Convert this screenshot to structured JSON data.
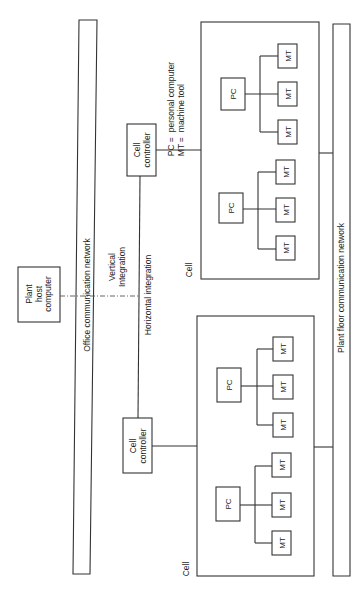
{
  "diagram": {
    "plant_host": {
      "label_lines": [
        "Plant",
        "host",
        "computer"
      ]
    },
    "office_network": {
      "label": "Office communication network"
    },
    "plant_floor_network": {
      "label": "Plant floor communication network"
    },
    "vertical_integration": {
      "label_lines": [
        "Vertical",
        "Integration"
      ]
    },
    "horizontal_integration": {
      "label": "Horizontal integration"
    },
    "cell_controller": {
      "label_lines": [
        "Cell",
        "controller"
      ]
    },
    "cell_label": "Cell",
    "pc_label": "PC",
    "mt_label": "MT",
    "legend": [
      {
        "abbr": "PC",
        "eq": "=",
        "meaning": "personal computer"
      },
      {
        "abbr": "MT",
        "eq": "=",
        "meaning": "machine tool"
      }
    ],
    "cells": [
      {
        "name": "upper-cell",
        "groups": 2,
        "pc_per_group": 1,
        "mt_per_group": 3
      },
      {
        "name": "lower-cell",
        "groups": 2,
        "pc_per_group": 1,
        "mt_per_group": 3
      }
    ]
  },
  "colors": {
    "line": "#333333",
    "background": "#ffffff"
  }
}
